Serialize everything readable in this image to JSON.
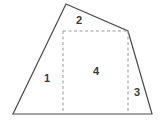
{
  "figure": {
    "type": "geometry-decomposition-diagram",
    "title": "",
    "canvas": {
      "width": 162,
      "height": 125
    },
    "colors": {
      "outline": "#4a4a4a",
      "dashed": "#9a9a9a",
      "label": "#3a3a3a",
      "background": "#ffffff"
    },
    "outline": {
      "name": "quadrilateral-outline",
      "closed": true,
      "points": [
        {
          "name": "apex-top",
          "x": 66,
          "y": 4
        },
        {
          "name": "upper-right",
          "x": 128,
          "y": 31
        },
        {
          "name": "bottom-right",
          "x": 152,
          "y": 114
        },
        {
          "name": "bottom-left",
          "x": 13,
          "y": 114
        }
      ],
      "stroke_width": 1.2
    },
    "dashed_lines": [
      {
        "name": "horizontal-divider",
        "x1": 63,
        "y1": 31,
        "x2": 128,
        "y2": 31
      },
      {
        "name": "left-vertical-divider",
        "x1": 63,
        "y1": 31,
        "x2": 63,
        "y2": 114
      },
      {
        "name": "right-vertical-divider",
        "x1": 128,
        "y1": 31,
        "x2": 128,
        "y2": 114
      }
    ],
    "regions": [
      {
        "id": "region-1",
        "label": "1",
        "x": 47,
        "y": 78
      },
      {
        "id": "region-2",
        "label": "2",
        "x": 79,
        "y": 20
      },
      {
        "id": "region-3",
        "label": "3",
        "x": 137,
        "y": 92
      },
      {
        "id": "region-4",
        "label": "4",
        "x": 96,
        "y": 71
      }
    ]
  }
}
